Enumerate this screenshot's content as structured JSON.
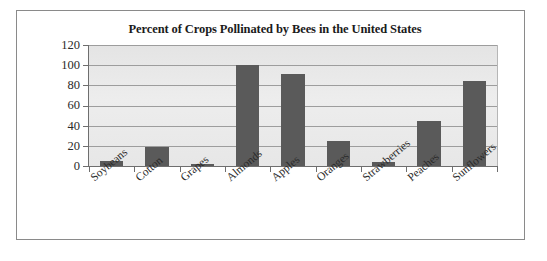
{
  "chart_data": {
    "type": "bar",
    "title": "Percent of Crops Pollinated by Bees in the United States",
    "xlabel": "",
    "ylabel": "",
    "categories": [
      "Soybeans",
      "Cotton",
      "Grapes",
      "Almonds",
      "Apples",
      "Oranges",
      "Strawberries",
      "Peaches",
      "Sunflowers"
    ],
    "values": [
      5,
      19,
      2,
      100,
      91,
      25,
      4,
      45,
      84
    ],
    "ylim": [
      0,
      120
    ],
    "yticks": [
      0,
      20,
      40,
      60,
      80,
      100,
      120
    ],
    "ytick_labels": [
      "0",
      "20",
      "40",
      "60",
      "80",
      "100",
      "120"
    ],
    "grid": true,
    "legend": false,
    "bar_color": "#5a5a5a",
    "plot_background": "#e9e9e9",
    "gridline_color": "#9d9d9d",
    "axis_color": "#6e6e6e",
    "frame_color": "#8a8a8a"
  }
}
